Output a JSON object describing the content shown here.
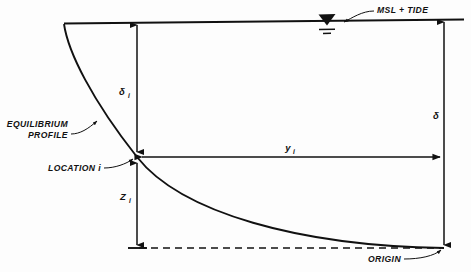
{
  "figure": {
    "type": "engineering-cross-section-diagram",
    "background_color": "#fdfdfd",
    "line_color": "#111111"
  },
  "labels": {
    "water_level": "MSL + TIDE",
    "profile": {
      "line1": "EQUILIBRIUM",
      "line2": "PROFILE"
    },
    "location": "LOCATION i",
    "origin": "ORIGIN",
    "depth_at_i": {
      "symbol": "δ",
      "subscript": "i"
    },
    "total_depth": {
      "symbol": "δ",
      "subscript": ""
    },
    "vertical_offset": {
      "symbol": "Z",
      "subscript": "i"
    },
    "horizontal_offset": {
      "symbol": "y",
      "subscript": "i"
    }
  },
  "geometry": {
    "waterline": {
      "x1": 64,
      "y1": 23,
      "x2": 464,
      "y2": 19
    },
    "profile_curve": "M64,24 C70,58 96,104 137,157 C180,212 300,246 444,248",
    "location_point": {
      "x": 137,
      "y": 157
    },
    "origin_point": {
      "x": 444,
      "y": 248
    },
    "datum_dashed": {
      "x1": 137,
      "y1": 248,
      "x2": 444,
      "y2": 248
    },
    "delta_i_dim": {
      "x": 137,
      "y_top": 23,
      "y_bottom": 157
    },
    "z_i_dim": {
      "x": 137,
      "y_top": 157,
      "y_bottom": 248
    },
    "y_i_dim": {
      "y": 157,
      "x_left": 137,
      "x_right": 444
    },
    "delta_dim": {
      "x": 444,
      "y_top": 20,
      "y_bottom": 248
    }
  },
  "water_symbol": {
    "name": "water-surface-triangle",
    "apex": {
      "x": 327,
      "y": 23
    },
    "hatch_lines": 2
  }
}
